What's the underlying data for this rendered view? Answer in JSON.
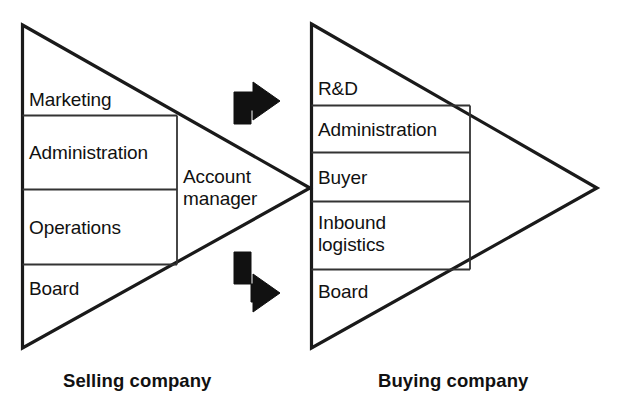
{
  "diagram": {
    "stroke_color": "#1a1a1a",
    "arrow_color": "#111111",
    "background_color": "#ffffff"
  },
  "selling_company": {
    "caption": "Selling company",
    "rows": [
      {
        "label": "Marketing"
      },
      {
        "label": "Administration"
      },
      {
        "label": "Operations"
      },
      {
        "label": "Board"
      }
    ],
    "interface_role": "Account manager",
    "interface_role_line1": "Account",
    "interface_role_line2": "manager"
  },
  "buying_company": {
    "caption": "Buying company",
    "rows": [
      {
        "label": "R&D"
      },
      {
        "label": "Administration"
      },
      {
        "label": "Buyer"
      },
      {
        "label": "Inbound logistics",
        "line1": "Inbound",
        "line2": "logistics"
      },
      {
        "label": "Board"
      }
    ]
  },
  "arrows": [
    {
      "name": "top-arrow",
      "direction": "up-then-right"
    },
    {
      "name": "bottom-arrow",
      "direction": "down-then-right"
    }
  ]
}
